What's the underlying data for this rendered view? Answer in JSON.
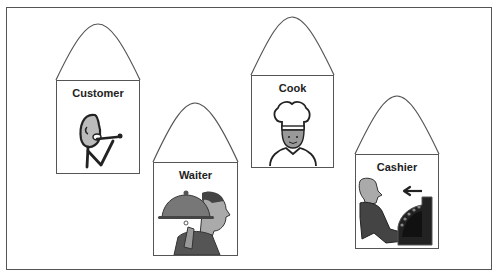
{
  "diagram": {
    "type": "role-cards",
    "cards": [
      {
        "id": "customer",
        "label": "Customer",
        "icon": "customer-eating-icon"
      },
      {
        "id": "waiter",
        "label": "Waiter",
        "icon": "waiter-with-cloche-icon"
      },
      {
        "id": "cook",
        "label": "Cook",
        "icon": "chef-icon"
      },
      {
        "id": "cashier",
        "label": "Cashier",
        "icon": "cashier-register-icon"
      }
    ]
  },
  "colors": {
    "frame": "#555555",
    "outline": "#555555",
    "text": "#222222",
    "figure_dark": "#444444",
    "figure_mid": "#888888",
    "figure_light": "#bbbbbb"
  }
}
